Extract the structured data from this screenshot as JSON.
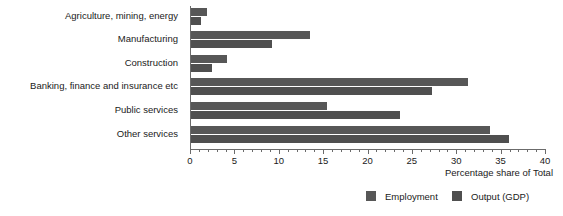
{
  "chart_data": {
    "type": "bar",
    "orientation": "horizontal",
    "title": "",
    "xlabel": "Percentage share of Total",
    "ylabel": "",
    "xlim": [
      0,
      40
    ],
    "xticks": [
      0,
      5,
      10,
      15,
      20,
      25,
      30,
      35,
      40
    ],
    "xtick_labels": [
      "0",
      "5",
      "10",
      "15",
      "20",
      "25",
      "30",
      "35",
      "40"
    ],
    "minor_tick_step": 1,
    "grid": false,
    "legend_position": "bottom-right",
    "categories": [
      "Agriculture, mining, energy",
      "Manufacturing",
      "Construction",
      "Banking, finance and insurance etc",
      "Public services",
      "Other services"
    ],
    "series": [
      {
        "name": "Employment",
        "color": "#575757",
        "values": [
          1.9,
          13.5,
          4.2,
          31.3,
          15.4,
          33.8
        ]
      },
      {
        "name": "Output (GDP)",
        "color": "#4f4f4f",
        "values": [
          1.2,
          9.2,
          2.5,
          27.3,
          23.7,
          35.9
        ]
      }
    ]
  },
  "legend": {
    "entries": [
      {
        "label": "Employment"
      },
      {
        "label": "Output (GDP)"
      }
    ]
  }
}
